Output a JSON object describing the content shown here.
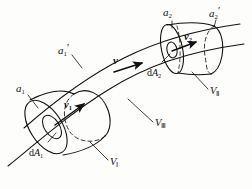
{
  "figure": {
    "type": "diagram",
    "background_color": "#fdfdfc",
    "stroke_color": "#101010"
  },
  "labels": {
    "a1": {
      "base": "a",
      "sub": "1",
      "prime": ""
    },
    "a1p": {
      "base": "a",
      "sub": "1",
      "prime": "′"
    },
    "a2": {
      "base": "a",
      "sub": "2",
      "prime": ""
    },
    "a2p": {
      "base": "a",
      "sub": "2",
      "prime": "′"
    },
    "v1": {
      "base": "v",
      "sub": "1"
    },
    "v2": {
      "base": "v",
      "sub": "2"
    },
    "v": {
      "base": "v"
    },
    "dA1": {
      "d": "d",
      "base": "A",
      "sub": "1"
    },
    "dA2": {
      "d": "d",
      "base": "A",
      "sub": "2"
    },
    "V1": {
      "base": "V",
      "sub": "Ⅰ"
    },
    "V2": {
      "base": "V",
      "sub": "Ⅱ"
    },
    "V3": {
      "base": "V",
      "sub": "Ⅲ"
    }
  },
  "text": {
    "a1": "a1",
    "a1_prime": "a1′",
    "a2": "a2",
    "a2_prime": "a2′",
    "v1": "v1",
    "v2": "v2",
    "v": "v",
    "dA1": "dA1",
    "dA2": "dA2",
    "V_I": "VⅠ",
    "V_II": "VⅡ",
    "V_III": "VⅢ"
  }
}
